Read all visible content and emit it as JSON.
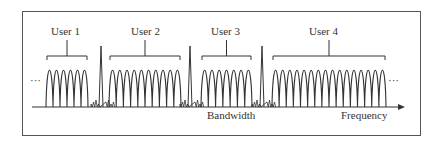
{
  "diagram": {
    "users": [
      {
        "label": "User 1",
        "lobes": 6,
        "x_start": 46,
        "x_end": 88
      },
      {
        "label": "User 2",
        "lobes": 10,
        "x_start": 109,
        "x_end": 181
      },
      {
        "label": "User 3",
        "lobes": 7,
        "x_start": 201,
        "x_end": 252
      },
      {
        "label": "User 4",
        "lobes": 16,
        "x_start": 272,
        "x_end": 386
      }
    ],
    "guard_spikes_x": [
      101,
      190,
      262
    ],
    "left_ellipsis": "···",
    "right_ellipsis": "···",
    "bandwidth_label": "Bandwidth",
    "frequency_label": "Frequency",
    "colors": {
      "line": "#333333",
      "frame": "#555555"
    }
  }
}
